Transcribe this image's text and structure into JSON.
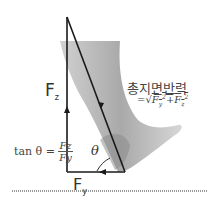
{
  "diagram": {
    "title": "총지면반력",
    "formula": "=√(Fy²+Fz²)",
    "formula_parts": {
      "prefix": "=√",
      "term1": "F",
      "sub1": "y",
      "sup1": "2",
      "plus": "+",
      "term2": "F",
      "sub2": "z",
      "sup2": "2"
    },
    "vertical_force": {
      "base": "F",
      "sub": "z"
    },
    "horizontal_force": {
      "base": "F",
      "sub": "y"
    },
    "angle": "θ",
    "tan_formula": {
      "lhs": "tan θ =",
      "numerator": "Fz",
      "denominator": "Fy"
    },
    "colors": {
      "lines": "#1a1a1a",
      "leg": "#8a8a8a",
      "text": "#333333"
    }
  }
}
